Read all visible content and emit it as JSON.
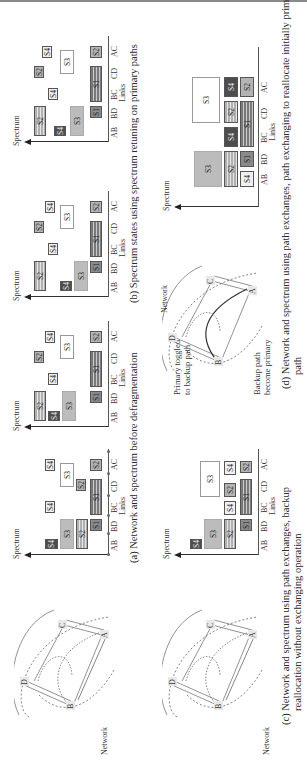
{
  "figure": {
    "orientation": "rotated 90 degrees counter-clockwise on page",
    "subfigures": [
      {
        "id": "a",
        "caption": "(a)  Network and spectrum before defragmentation",
        "network_label": "Network",
        "nodes": [
          "A",
          "B",
          "C",
          "D"
        ],
        "charts": [
          {
            "y_label": "Spectrum",
            "x_label": "Links",
            "links": [
              "AB",
              "BD",
              "BC",
              "CD",
              "AC"
            ],
            "slots": [
              {
                "label": "S4",
                "link_span": [
                  "AB"
                ],
                "level": 4,
                "style": "dark"
              },
              {
                "label": "S3",
                "link_span": [
                  "AB",
                  "BD"
                ],
                "level": 3,
                "style": "gray"
              },
              {
                "label": "S2",
                "link_span": [
                  "AB",
                  "BD"
                ],
                "level": 2,
                "style": "striped-light"
              },
              {
                "label": "S1",
                "link_span": [
                  "BD"
                ],
                "level": 1,
                "style": "mid"
              },
              {
                "label": "S4",
                "link_span": [
                  "BC"
                ],
                "level": 4,
                "style": "light"
              },
              {
                "label": "S1",
                "link_span": [
                  "BC",
                  "CD"
                ],
                "level": 1,
                "style": "striped-dark"
              },
              {
                "label": "S2",
                "link_span": [
                  "CD"
                ],
                "level": 2,
                "style": "gray-solid"
              },
              {
                "label": "S3",
                "link_span": [
                  "CD",
                  "AC"
                ],
                "level": 3,
                "style": "white"
              },
              {
                "label": "S4",
                "link_span": [
                  "AC"
                ],
                "level": 4,
                "style": "light"
              },
              {
                "label": "S2",
                "link_span": [
                  "AC"
                ],
                "level": 1,
                "style": "gray-solid"
              }
            ]
          }
        ]
      },
      {
        "id": "b",
        "caption": "(b)  Spectrum states using spectrum retuning on primary paths",
        "charts": [
          {
            "y_label": "Spectrum",
            "x_label": "Links",
            "links": [
              "AB",
              "BD",
              "BC",
              "CD",
              "AC"
            ]
          },
          {
            "y_label": "Spectrum",
            "x_label": "Links",
            "links": [
              "AB",
              "BD",
              "BC",
              "CD",
              "AC"
            ]
          },
          {
            "y_label": "Spectrum",
            "x_label": "Links",
            "links": [
              "AB",
              "BD",
              "BC",
              "CD",
              "AC"
            ]
          }
        ]
      },
      {
        "id": "c",
        "caption_line1": "(c)  Network and spectrum using path exchanges, backup",
        "caption_line2": "reallocation without exchanging operation",
        "network_label": "Network",
        "nodes": [
          "A",
          "B",
          "C",
          "D"
        ],
        "charts": [
          {
            "y_label": "Spectrum",
            "x_label": "Links",
            "links": [
              "AB",
              "BD",
              "BC",
              "CD",
              "AC"
            ]
          }
        ]
      },
      {
        "id": "d",
        "caption_line1": "(d)  Network and spectrum using path exchanges, path exchanging to reallocate initially primary",
        "caption_line2": "path",
        "network_label": "Network",
        "nodes": [
          "A",
          "B",
          "C",
          "D"
        ],
        "annotations": [
          "Primary toggled",
          "to backup path",
          "Backup path",
          "become primary"
        ],
        "charts": [
          {
            "y_label": "Spectrum",
            "x_label": "Links",
            "links": [
              "AB",
              "BD",
              "BC",
              "CD",
              "AC"
            ]
          }
        ]
      }
    ]
  },
  "labels": {
    "spectrum": "Spectrum",
    "links": "Links",
    "network": "Network",
    "AB": "AB",
    "BD": "BD",
    "BC": "BC",
    "CD": "CD",
    "AC": "AC",
    "S1": "S1",
    "S2": "S2",
    "S3": "S3",
    "S4": "S4",
    "A": "A",
    "B": "B",
    "C": "C",
    "D": "D"
  },
  "captions": {
    "a": "(a)  Network and spectrum before defragmentation",
    "b": "(b)  Spectrum states using spectrum retuning on primary paths",
    "c1": "(c)  Network and spectrum using path exchanges, backup",
    "c2": "reallocation without exchanging operation",
    "d1": "(d)  Network and spectrum using path exchanges, path exchanging to reallocate initially primary",
    "d2": "path"
  },
  "annotations": {
    "primary_toggled_1": "Primary toggled",
    "primary_toggled_2": "to backup path",
    "backup_path_1": "Backup path",
    "backup_path_2": "become primary"
  },
  "colors": {
    "dark": "#4d4d4d",
    "mid": "#8a8a8a",
    "gray": "#bcbcbc",
    "light": "#f0f0f0",
    "axis": "#333333"
  }
}
